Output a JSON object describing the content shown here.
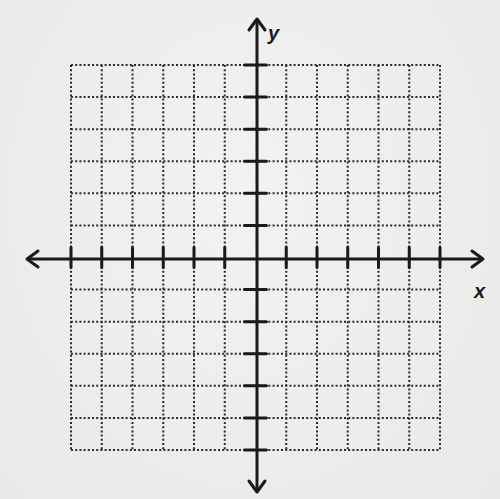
{
  "chart_data": {
    "type": "coordinate_grid",
    "title": "",
    "xlabel": "x",
    "ylabel": "y",
    "grid": {
      "columns": 12,
      "rows": 12,
      "style": "dotted",
      "origin_column": 6,
      "origin_row": 6
    },
    "xlim": [
      -6,
      6
    ],
    "ylim": [
      -6,
      6
    ],
    "x_ticks_count": 12,
    "y_ticks_count": 12,
    "tick_labels": false,
    "axes_arrows": [
      "left",
      "right",
      "up",
      "down"
    ],
    "series": []
  },
  "labels": {
    "x_axis": "x",
    "y_axis": "y"
  },
  "colors": {
    "ink": "#1a1a1a",
    "grid": "#2a2a2a",
    "paper": "#efefed"
  }
}
